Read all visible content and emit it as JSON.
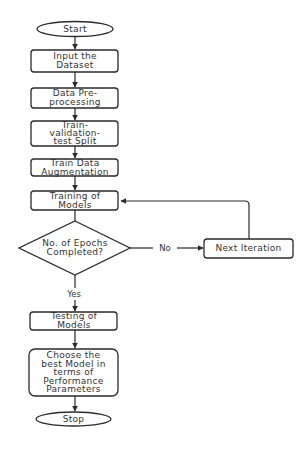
{
  "diagram": {
    "type": "flowchart",
    "nodes": [
      {
        "id": "start",
        "shape": "terminator",
        "lines": [
          "Start"
        ]
      },
      {
        "id": "input",
        "shape": "process",
        "lines": [
          "Input the",
          "Dataset"
        ]
      },
      {
        "id": "preproc",
        "shape": "process",
        "lines": [
          "Data Pre-",
          "processing"
        ]
      },
      {
        "id": "split",
        "shape": "process",
        "lines": [
          "Train-",
          "validation-",
          "test Split"
        ]
      },
      {
        "id": "augment",
        "shape": "process",
        "lines": [
          "Train Data",
          "Augmentation"
        ]
      },
      {
        "id": "training",
        "shape": "process",
        "lines": [
          "Training of",
          "Models"
        ]
      },
      {
        "id": "decision",
        "shape": "decision",
        "lines": [
          "No. of Epochs",
          "Completed?"
        ]
      },
      {
        "id": "next",
        "shape": "process",
        "lines": [
          "Next Iteration"
        ]
      },
      {
        "id": "testing",
        "shape": "process",
        "lines": [
          "Testing of",
          "Models"
        ]
      },
      {
        "id": "choose",
        "shape": "process",
        "lines": [
          "Choose the",
          "best Model in",
          "terms of",
          "Performance",
          "Parameters"
        ]
      },
      {
        "id": "stop",
        "shape": "terminator",
        "lines": [
          "Stop"
        ]
      }
    ],
    "edges": [
      {
        "from": "start",
        "to": "input",
        "label": ""
      },
      {
        "from": "input",
        "to": "preproc",
        "label": ""
      },
      {
        "from": "preproc",
        "to": "split",
        "label": ""
      },
      {
        "from": "split",
        "to": "augment",
        "label": ""
      },
      {
        "from": "augment",
        "to": "training",
        "label": ""
      },
      {
        "from": "training",
        "to": "decision",
        "label": ""
      },
      {
        "from": "decision",
        "to": "next",
        "label": "No"
      },
      {
        "from": "next",
        "to": "training",
        "label": ""
      },
      {
        "from": "decision",
        "to": "testing",
        "label": "Yes"
      },
      {
        "from": "testing",
        "to": "choose",
        "label": ""
      },
      {
        "from": "choose",
        "to": "stop",
        "label": ""
      }
    ]
  },
  "labels": {
    "start": "Start",
    "input": [
      "Input the",
      "Dataset"
    ],
    "preproc": [
      "Data Pre-",
      "processing"
    ],
    "split": [
      "Train-",
      "validation-",
      "test Split"
    ],
    "augment": [
      "Train Data",
      "Augmentation"
    ],
    "training": [
      "Training of",
      "Models"
    ],
    "decision": [
      "No. of Epochs",
      "Completed?"
    ],
    "next": "Next Iteration",
    "no": "No",
    "yes": "Yes",
    "testing": [
      "Testing of",
      "Models"
    ],
    "choose": [
      "Choose the",
      "best Model in",
      "terms of",
      "Performance",
      "Parameters"
    ],
    "stop": "Stop"
  },
  "colors": {
    "stroke": "#2a2a2a",
    "text": "#333333",
    "background": "#ffffff"
  }
}
